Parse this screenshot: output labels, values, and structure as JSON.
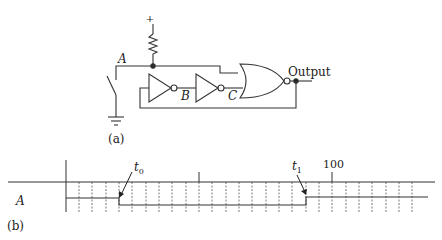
{
  "circuit": {
    "caption": "(a)",
    "supply_symbol": "+",
    "node_a_label": "A",
    "inverter_b_label": "B",
    "inverter_c_label": "C",
    "output_label": "Output",
    "components": [
      "pull-up-resistor",
      "switch-to-ground",
      "inverter-B",
      "inverter-C",
      "nor-gate"
    ]
  },
  "timing": {
    "caption": "(b)",
    "signal_label": "A",
    "t0_label": "t",
    "t0_sub": "0",
    "t1_label": "t",
    "t1_sub": "1",
    "tick_label": "100"
  },
  "colors": {
    "line": "#333333",
    "grid": "#555555",
    "background": "#ffffff"
  }
}
